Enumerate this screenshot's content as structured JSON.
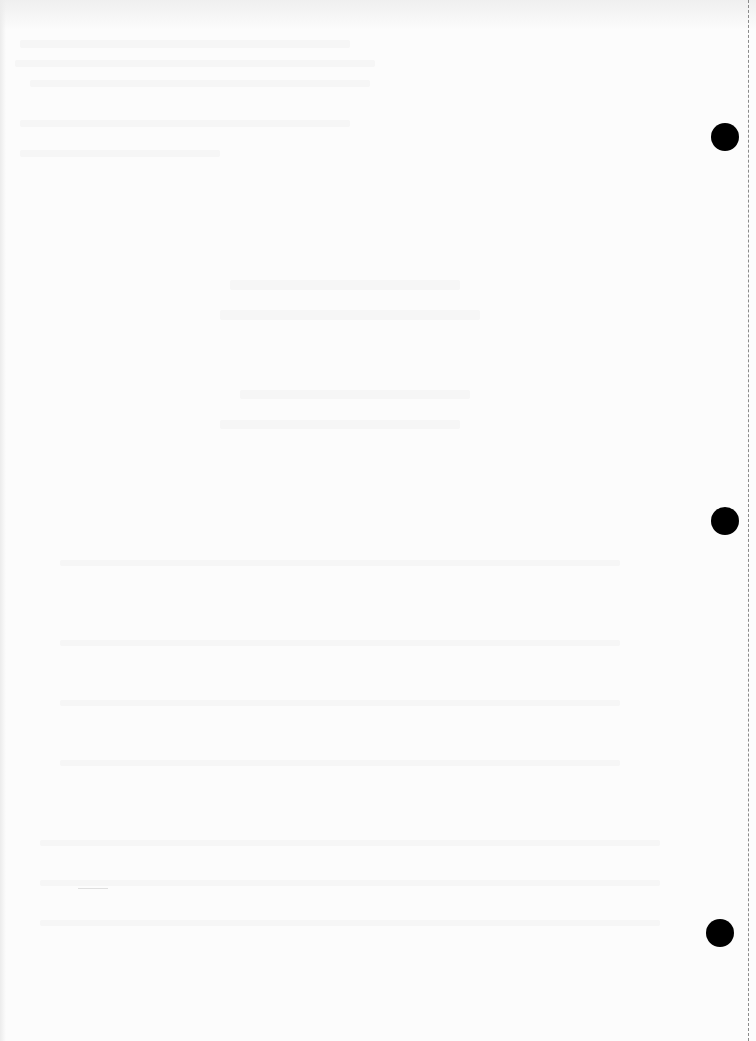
{
  "document": {
    "type": "blank scanned page",
    "background_color": "#fcfcfc",
    "text_content": ""
  },
  "punch_holes": [
    {
      "cx": 725,
      "cy": 137,
      "r": 14
    },
    {
      "cx": 725,
      "cy": 521,
      "r": 14
    },
    {
      "cx": 720,
      "cy": 933,
      "r": 14
    }
  ],
  "perforation_line": {
    "x": 748,
    "style": "dashed",
    "color": "#8a8a8a"
  },
  "colors": {
    "hole": "#000000",
    "paper": "#fcfcfc"
  }
}
